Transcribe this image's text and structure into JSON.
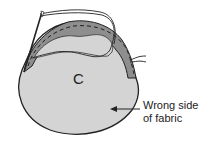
{
  "figure": {
    "piece_label": "C",
    "callout": {
      "line1": "Wrong side",
      "line2": "of fabric"
    },
    "colors": {
      "fabric_fill": "#d4d4d4",
      "gathered_band": "#8e8e8e",
      "outline": "#222222",
      "background": "#ffffff"
    },
    "elements": [
      "fabric-piece",
      "gathered-edge",
      "needle",
      "thread",
      "arrow"
    ]
  }
}
